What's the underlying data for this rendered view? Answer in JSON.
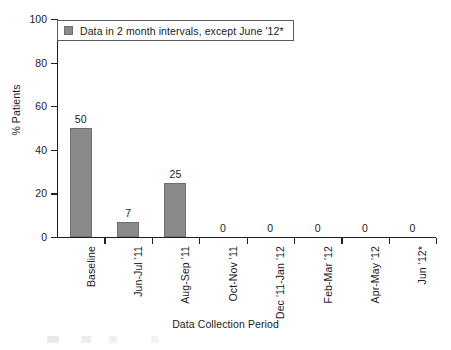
{
  "chart_data": {
    "type": "bar",
    "title": "",
    "xlabel": "Data Collection Period",
    "ylabel": "% Patients",
    "categories": [
      "Baseline",
      "Jun-Jul '11",
      "Aug-Sep '11",
      "Oct-Nov '11",
      "Dec '11-Jan '12",
      "Feb-Mar '12",
      "Apr-May '12",
      "Jun '12*"
    ],
    "values": [
      50,
      7,
      25,
      0,
      0,
      0,
      0,
      0
    ],
    "value_labels": [
      "50",
      "7",
      "25",
      "0",
      "0",
      "0",
      "0",
      "0"
    ],
    "ylim": [
      0,
      100
    ],
    "yticks": [
      0,
      20,
      40,
      60,
      80,
      100
    ],
    "ytick_labels": [
      "0",
      "20",
      "40",
      "60",
      "80",
      "100"
    ],
    "grid": false,
    "legend_position": "upper-left-inside",
    "legend": [
      {
        "label": "Data in 2 month intervals, except June '12*",
        "color": "#8a8a8a"
      }
    ],
    "bar_color": "#8a8a8a",
    "axis_color": "#1f1f1f",
    "background_color": "#ffffff"
  }
}
